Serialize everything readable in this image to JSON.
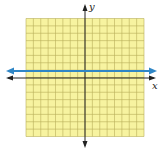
{
  "figure": {
    "x_axis_label": "x",
    "y_axis_label": "y",
    "grid_cells": 16,
    "grid_fill": "#f7f3a0",
    "grid_line_color": "#b8ae5a",
    "axis_color": "#222222",
    "line_color": "#2f86c6"
  },
  "chart_data": {
    "type": "line",
    "title": "",
    "xlabel": "x",
    "ylabel": "y",
    "xlim": [
      -8,
      8
    ],
    "ylim": [
      -8,
      8
    ],
    "grid": true,
    "series": [
      {
        "name": "y = 1",
        "x": [
          -8,
          8
        ],
        "y": [
          1,
          1
        ]
      }
    ]
  }
}
